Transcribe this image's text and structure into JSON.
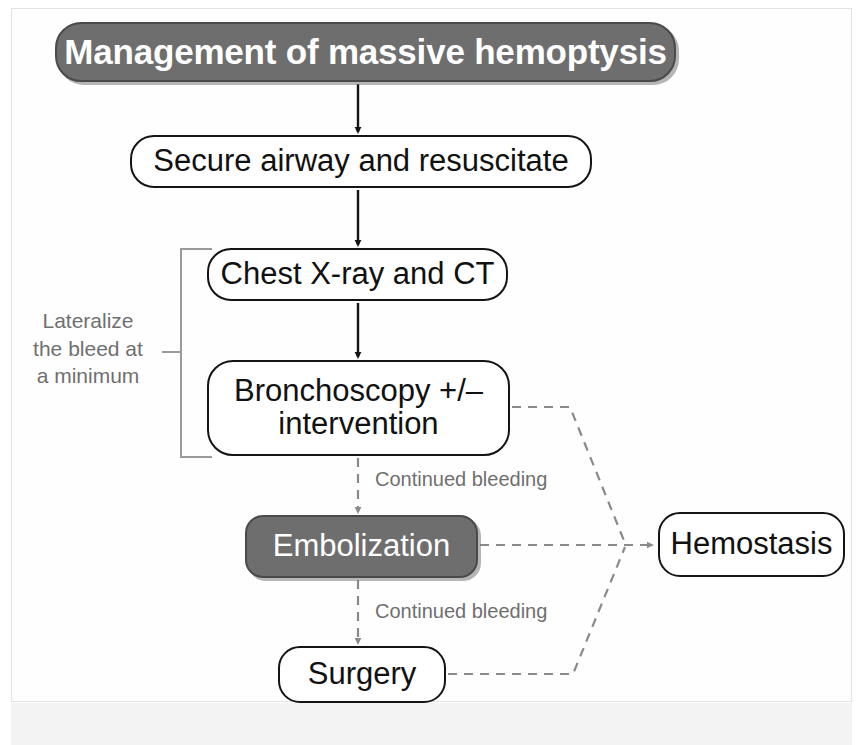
{
  "figure": {
    "kind": "clinical-algorithm-flowchart",
    "title": "Management of massive hemoptysis",
    "colors": {
      "node_fill_default": "#ffffff",
      "node_fill_highlight": "#6e6e6e",
      "node_border": "#141414",
      "node_text": "#111111",
      "node_text_highlight": "#ffffff",
      "solid_edge": "#141414",
      "dashed_edge": "#8a8a8a",
      "annotation_text": "#6f6f6f",
      "page_background": "#ffffff"
    }
  },
  "nodes": {
    "title": {
      "label": "Management of massive hemoptysis",
      "style": "filled"
    },
    "secure": {
      "label": "Secure airway and resuscitate",
      "style": "outline"
    },
    "cxr": {
      "label": "Chest X-ray and CT",
      "style": "outline"
    },
    "bronchoscopy": {
      "line1": "Bronchoscopy +/–",
      "line2": "intervention",
      "style": "outline"
    },
    "embolization": {
      "label": "Embolization",
      "style": "filled"
    },
    "surgery": {
      "label": "Surgery",
      "style": "outline"
    },
    "hemostasis": {
      "label": "Hemostasis",
      "style": "outline"
    }
  },
  "edge_labels": {
    "continued_bleeding_1": "Continued bleeding",
    "continued_bleeding_2": "Continued bleeding"
  },
  "annotation": {
    "bracket_note_line1": "Lateralize",
    "bracket_note_line2": "the bleed at",
    "bracket_note_line3": "a minimum"
  }
}
